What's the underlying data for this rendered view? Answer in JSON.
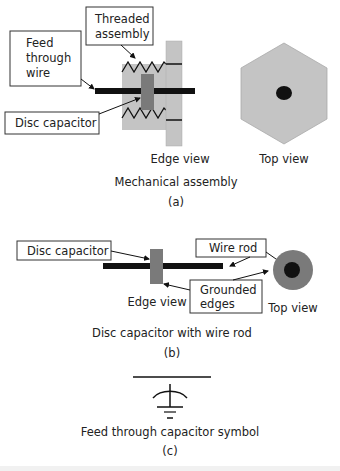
{
  "panel_a": {
    "labels": {
      "threaded_assembly_1": "Threaded",
      "threaded_assembly_2": "assembly",
      "feed_1": "Feed",
      "feed_2": "through",
      "feed_3": "wire",
      "disc_capacitor": "Disc capacitor"
    },
    "edge_view": "Edge view",
    "top_view": "Top view",
    "title": "Mechanical assembly",
    "tag": "(a)"
  },
  "panel_b": {
    "labels": {
      "disc_capacitor": "Disc capacitor",
      "wire_rod": "Wire rod",
      "grounded_1": "Grounded",
      "grounded_2": "edges"
    },
    "edge_view": "Edge view",
    "top_view": "Top view",
    "title": "Disc capacitor with wire rod",
    "tag": "(b)"
  },
  "panel_c": {
    "title": "Feed through capacitor symbol",
    "tag": "(c)"
  },
  "colors": {
    "light_gray": "#c4c4c4",
    "medium_gray": "#7a7a7a",
    "dark_gray": "#8a8a8a",
    "black": "#111111"
  }
}
